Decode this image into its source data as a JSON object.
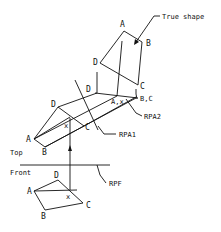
{
  "diagram": {
    "labels": {
      "true_shape": "True shape",
      "rpa2": "RPA2",
      "rpa1": "RPA1",
      "rpf": "RPF",
      "top": "Top",
      "front": "Front"
    },
    "views": {
      "true_shape": {
        "A": "A",
        "B": "B",
        "C": "C",
        "D": "D"
      },
      "aux1": {
        "D": "D",
        "A_x": "A,x",
        "BC": "B,C"
      },
      "top": {
        "A": "A",
        "B": "B",
        "C": "C",
        "D": "D",
        "x": "x"
      },
      "front": {
        "A": "A",
        "B": "B",
        "C": "C",
        "D": "D",
        "x": "x"
      }
    },
    "colors": {
      "line": "#111111",
      "background": "#ffffff"
    }
  }
}
